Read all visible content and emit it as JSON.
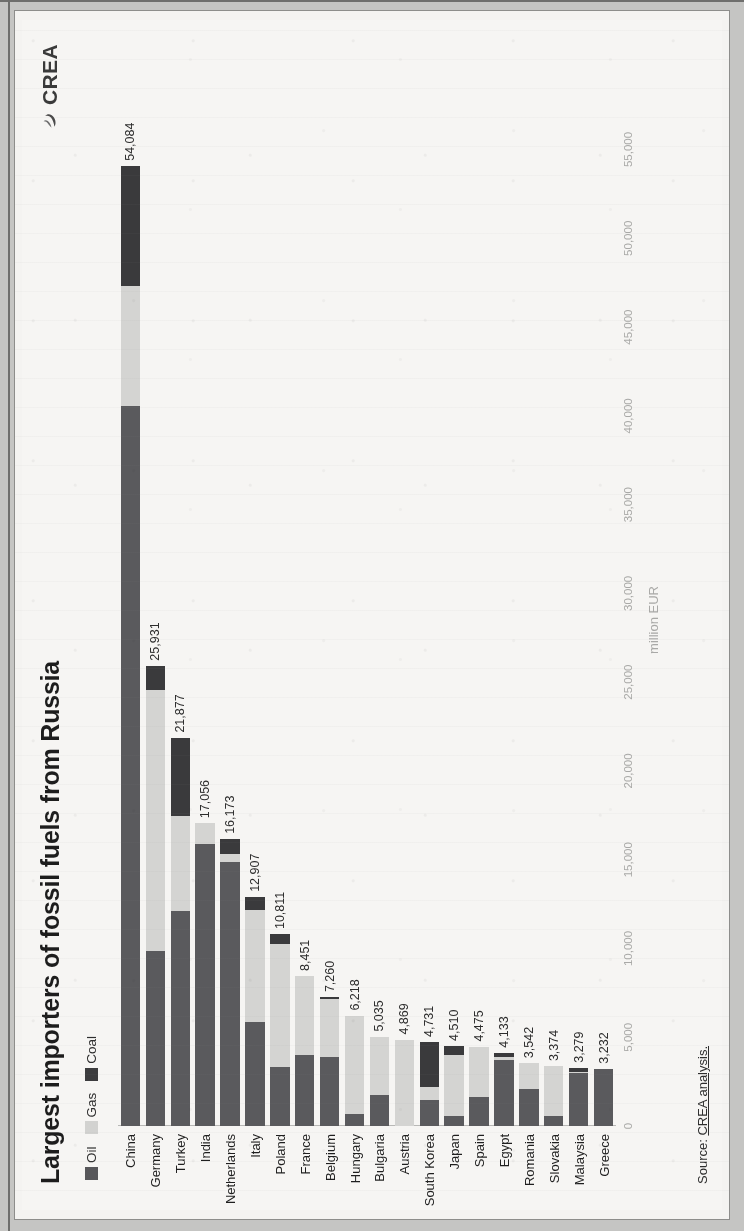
{
  "title": "Largest importers of fossil fuels from Russia",
  "logo": {
    "text": "CREA",
    "icon": "crea-swirl-icon"
  },
  "legend": {
    "items": [
      {
        "label": "Oil",
        "color": "#57575a"
      },
      {
        "label": "Gas",
        "color": "#d2d2d0"
      },
      {
        "label": "Coal",
        "color": "#3c3c3e"
      }
    ]
  },
  "source": {
    "prefix": "Source: ",
    "link": "CREA analysis."
  },
  "chart_data": {
    "type": "bar",
    "orientation": "vertical",
    "stacked": true,
    "title": "Largest importers of fossil fuels from Russia",
    "xlabel": "",
    "ylabel": "million EUR",
    "ylim": [
      0,
      57000
    ],
    "grid": false,
    "legend_position": "top-left",
    "tick_labels": [
      "0",
      "5,000",
      "10,000",
      "15,000",
      "20,000",
      "25,000",
      "30,000",
      "35,000",
      "40,000",
      "45,000",
      "50,000",
      "55,000"
    ],
    "ticks": [
      0,
      5000,
      10000,
      15000,
      20000,
      25000,
      30000,
      35000,
      40000,
      45000,
      50000,
      55000
    ],
    "categories": [
      "China",
      "Germany",
      "Turkey",
      "India",
      "Netherlands",
      "Italy",
      "Poland",
      "France",
      "Belgium",
      "Hungary",
      "Bulgaria",
      "Austria",
      "South Korea",
      "Japan",
      "Spain",
      "Egypt",
      "Romania",
      "Slovakia",
      "Malaysia",
      "Greece"
    ],
    "series": [
      {
        "name": "Oil",
        "color": "#5a5a5d",
        "values": [
          40560,
          9880,
          12100,
          15900,
          14850,
          5850,
          3350,
          3980,
          3880,
          650,
          1760,
          0,
          1480,
          560,
          1630,
          3700,
          2100,
          550,
          2980,
          3232
        ]
      },
      {
        "name": "Gas",
        "color": "#d4d4d2",
        "values": [
          6780,
          14650,
          5380,
          1156,
          490,
          6310,
          6900,
          4471,
          3295,
          5568,
          3275,
          4869,
          710,
          3420,
          2845,
          180,
          1442,
          2824,
          60,
          0
        ]
      },
      {
        "name": "Coal",
        "color": "#3a3a3c",
        "values": [
          6744,
          1401,
          4397,
          0,
          833,
          747,
          561,
          0,
          85,
          0,
          0,
          0,
          2541,
          530,
          0,
          253,
          0,
          0,
          239,
          0
        ]
      }
    ],
    "totals": [
      "54,084",
      "25,931",
      "21,877",
      "17,056",
      "16,173",
      "12,907",
      "10,811",
      "8,451",
      "7,260",
      "6,218",
      "5,035",
      "4,869",
      "4,731",
      "4,510",
      "4,475",
      "4,133",
      "3,542",
      "3,374",
      "3,279",
      "3,232"
    ],
    "total_values": [
      54084,
      25931,
      21877,
      17056,
      16173,
      12907,
      10811,
      8451,
      7260,
      6218,
      5035,
      4869,
      4731,
      4510,
      4475,
      4133,
      3542,
      3374,
      3279,
      3232
    ]
  }
}
